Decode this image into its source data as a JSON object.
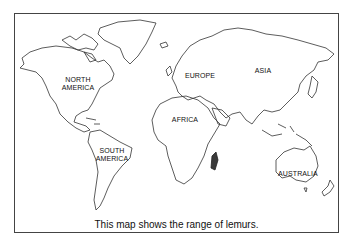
{
  "map": {
    "title": "World map",
    "continents": [
      {
        "name": "north-america",
        "label_lines": [
          "NORTH",
          "AMERICA"
        ]
      },
      {
        "name": "south-america",
        "label_lines": [
          "SOUTH",
          "AMERICA"
        ]
      },
      {
        "name": "europe",
        "label_lines": [
          "EUROPE"
        ]
      },
      {
        "name": "africa",
        "label_lines": [
          "AFRICA"
        ]
      },
      {
        "name": "asia",
        "label_lines": [
          "ASIA"
        ]
      },
      {
        "name": "australia",
        "label_lines": [
          "AUSTRALIA"
        ]
      }
    ],
    "highlight": {
      "region": "Madagascar",
      "color": "#3a3a3a"
    },
    "outline_color": "#333333"
  },
  "caption": "This map shows the range of lemurs."
}
